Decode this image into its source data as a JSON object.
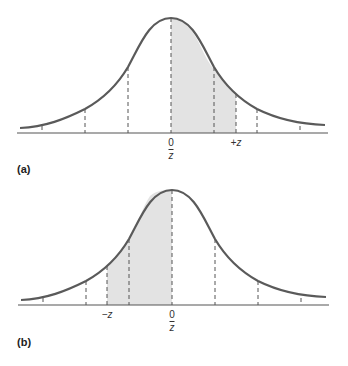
{
  "colors": {
    "curve": "#5a5a5a",
    "shade": "#e3e3e3",
    "axis": "#555555",
    "dash": "#555555"
  },
  "panels": [
    {
      "id": "a",
      "label": "(a)",
      "mean_label": "0",
      "mean_symbol": "z",
      "z_label": "+z",
      "shaded_region": "from mean (0) to +z"
    },
    {
      "id": "b",
      "label": "(b)",
      "mean_label": "0",
      "mean_symbol": "z",
      "z_label": "−z",
      "shaded_region": "from −z to mean (0)"
    }
  ]
}
